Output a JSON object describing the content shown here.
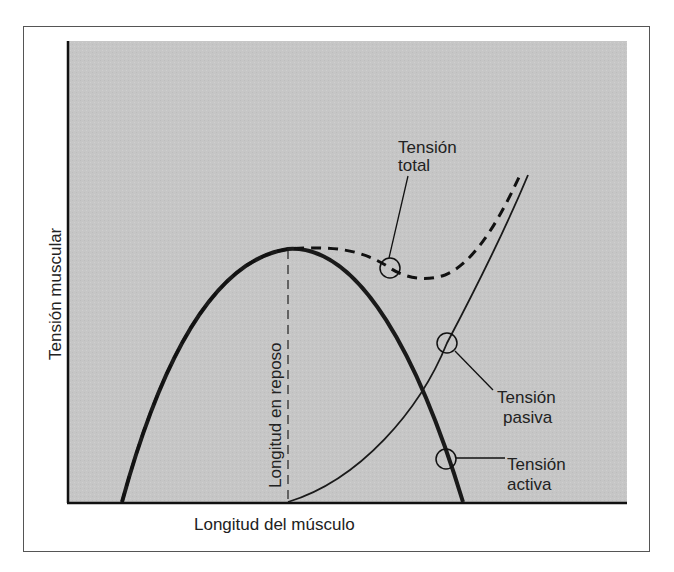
{
  "diagram": {
    "y_axis_label": "Tensión muscular",
    "x_axis_label": "Longitud del músculo",
    "rest_length_label": "Longitud en reposo",
    "labels": {
      "total": [
        "Tensión",
        "total"
      ],
      "passive": [
        "Tensión",
        "pasiva"
      ],
      "active": [
        "Tensión",
        "activa"
      ]
    },
    "colors": {
      "plot_background": "#c4c4c4",
      "curve": "#1a1a1a",
      "frame": "#555555"
    },
    "curves": [
      {
        "name": "Tensión activa",
        "style": "thick solid",
        "shape": "inverted parabola peaking at rest length"
      },
      {
        "name": "Tensión pasiva",
        "style": "thin solid",
        "shape": "exponential rise starting at rest length"
      },
      {
        "name": "Tensión total",
        "style": "dashed",
        "shape": "sum of active and passive; dips after peak then rises"
      }
    ]
  }
}
